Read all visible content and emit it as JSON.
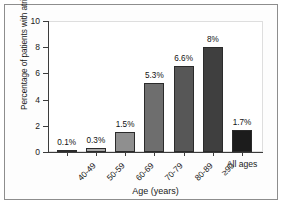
{
  "chart_data": {
    "type": "bar",
    "title": "",
    "xlabel": "Age (years)",
    "ylabel": "Percentage of patients with atrial fibrillation",
    "categories": [
      "40-49",
      "50-59",
      "60-69",
      "70-79",
      "80-89",
      "≥90",
      "All ages"
    ],
    "values": [
      0.1,
      0.3,
      1.5,
      5.3,
      6.6,
      8.0,
      1.7
    ],
    "data_labels": [
      "0.1%",
      "0.3%",
      "1.5%",
      "5.3%",
      "6.6%",
      "8%",
      "1.7%"
    ],
    "bar_colors": [
      "#b0b0b0",
      "#a8a8a8",
      "#8f8f8f",
      "#6e6e6e",
      "#575757",
      "#3f3f3f",
      "#1c1c1c"
    ],
    "ylim": [
      0,
      10
    ],
    "yticks": [
      0,
      2,
      4,
      6,
      8,
      10
    ],
    "ytick_labels": [
      "0",
      "2",
      "4",
      "6",
      "8",
      "10"
    ],
    "grid": false,
    "legend": "none",
    "separated_last_category": true
  },
  "figure": {
    "frame_color": "#8d8d8d",
    "axis_color": "#3c3c3c",
    "background": "#ffffff"
  }
}
